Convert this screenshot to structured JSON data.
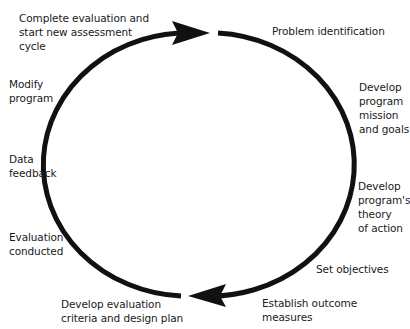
{
  "diagram": {
    "type": "cycle",
    "direction": "clockwise",
    "stroke_color": "#111111",
    "text_color": "#1a1a1a",
    "steps": [
      {
        "id": "problem-identification",
        "label": "Problem identification"
      },
      {
        "id": "develop-mission-goals",
        "label": "Develop\nprogram\nmission\nand goals"
      },
      {
        "id": "develop-theory-of-action",
        "label": "Develop\nprogram's\ntheory\nof action"
      },
      {
        "id": "set-objectives",
        "label": "Set objectives"
      },
      {
        "id": "establish-outcome-measures",
        "label": "Establish outcome\nmeasures"
      },
      {
        "id": "develop-evaluation-criteria",
        "label": "Develop evaluation\ncriteria and design plan"
      },
      {
        "id": "evaluation-conducted",
        "label": "Evaluation\nconducted"
      },
      {
        "id": "data-feedback",
        "label": "Data\nfeedback"
      },
      {
        "id": "modify-program",
        "label": "Modify\nprogram"
      },
      {
        "id": "complete-evaluation",
        "label": "Complete evaluation and\nstart new assessment\ncycle"
      }
    ]
  }
}
